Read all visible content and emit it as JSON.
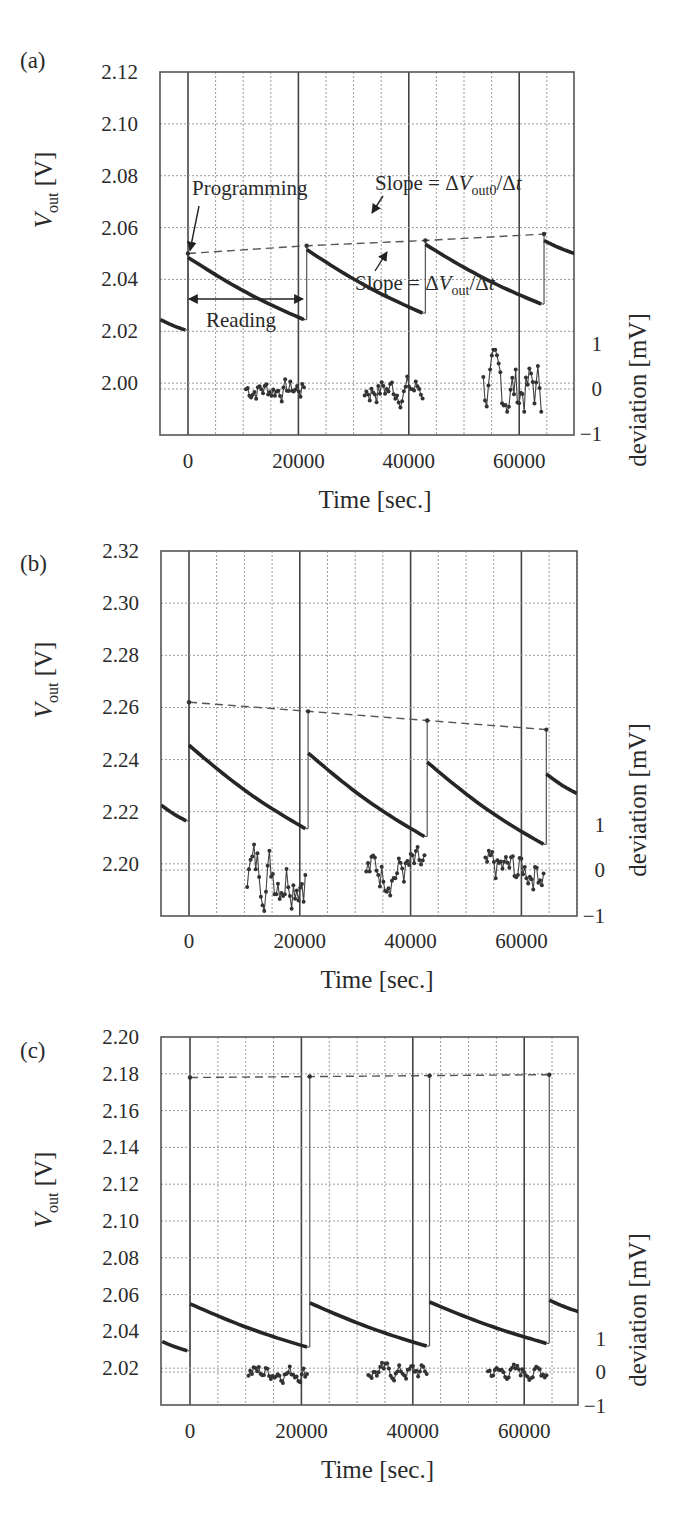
{
  "figure": {
    "width": 696,
    "height": 1529,
    "x_axis_title": "Time [sec.]",
    "y_axis_title_main": "V",
    "y_axis_title_sub": "out",
    "y_axis_title_unit": " [V]",
    "y2_axis_title": "deviation [mV]"
  },
  "chart_data": [
    {
      "panel": "(a)",
      "type": "line",
      "xlabel": "Time [sec.]",
      "ylabel": "V_out [V]",
      "y2label": "deviation [mV]",
      "xlim": [
        -5000,
        70000
      ],
      "ylim": [
        1.98,
        2.12
      ],
      "x_ticks": [
        0,
        20000,
        40000,
        60000
      ],
      "y_ticks": [
        2.0,
        2.02,
        2.04,
        2.06,
        2.08,
        2.1,
        2.12
      ],
      "y_tick_labels": [
        "2.00",
        "2.02",
        "2.04",
        "2.06",
        "2.08",
        "2.10",
        "2.12"
      ],
      "y2_ticks": [
        1,
        0,
        -1
      ],
      "y2_tick_labels": [
        "1",
        "0",
        "−1"
      ],
      "grid": true,
      "programming_times": [
        0,
        21500,
        43000,
        64500
      ],
      "series": [
        {
          "name": "V_out reading",
          "segments": [
            {
              "x": [
                -5000,
                -500
              ],
              "y": [
                2.0245,
                2.0205
              ]
            },
            {
              "x": [
                0,
                21000
              ],
              "y": [
                2.0485,
                2.0245
              ]
            },
            {
              "x": [
                21500,
                42500
              ],
              "y": [
                2.0515,
                2.027
              ]
            },
            {
              "x": [
                43000,
                64000
              ],
              "y": [
                2.0535,
                2.0305
              ]
            },
            {
              "x": [
                64500,
                70000
              ],
              "y": [
                2.055,
                2.05
              ]
            }
          ]
        },
        {
          "name": "V_out0 (programmed)",
          "style": "dashed",
          "x": [
            0,
            21500,
            43000,
            64500
          ],
          "y": [
            2.05,
            2.053,
            2.055,
            2.0575
          ]
        },
        {
          "name": "deviation",
          "axis": "y2",
          "ranges": [
            [
              10500,
              21000
            ],
            [
              32000,
              42500
            ],
            [
              53500,
              64000
            ]
          ],
          "amplitude_mV": [
            0.35,
            0.45,
            0.9
          ]
        }
      ],
      "annotations": [
        {
          "text": "Programming",
          "x": 0,
          "y": 2.05
        },
        {
          "text": "Slope = ΔV_out0/Δt",
          "x": 35000,
          "y": 2.055
        },
        {
          "text": "Slope = ΔV_out/Δt",
          "x": 35000,
          "y": 2.03
        },
        {
          "text": "Reading",
          "x_range": [
            0,
            21000
          ]
        }
      ]
    },
    {
      "panel": "(b)",
      "type": "line",
      "xlabel": "Time [sec.]",
      "ylabel": "V_out [V]",
      "y2label": "deviation [mV]",
      "xlim": [
        -5000,
        70000
      ],
      "ylim": [
        2.18,
        2.32
      ],
      "x_ticks": [
        0,
        20000,
        40000,
        60000
      ],
      "y_ticks": [
        2.2,
        2.22,
        2.24,
        2.26,
        2.28,
        2.3,
        2.32
      ],
      "y_tick_labels": [
        "2.20",
        "2.22",
        "2.24",
        "2.26",
        "2.28",
        "2.30",
        "2.32"
      ],
      "y2_ticks": [
        1,
        0,
        -1
      ],
      "y2_tick_labels": [
        "1",
        "0",
        "−1"
      ],
      "grid": true,
      "programming_times": [
        0,
        21500,
        43000,
        64500
      ],
      "series": [
        {
          "name": "V_out reading",
          "segments": [
            {
              "x": [
                -5000,
                -500
              ],
              "y": [
                2.2225,
                2.2165
              ]
            },
            {
              "x": [
                0,
                21000
              ],
              "y": [
                2.2455,
                2.2135
              ]
            },
            {
              "x": [
                21500,
                42500
              ],
              "y": [
                2.2425,
                2.2105
              ]
            },
            {
              "x": [
                43000,
                64000
              ],
              "y": [
                2.239,
                2.2075
              ]
            },
            {
              "x": [
                64500,
                70000
              ],
              "y": [
                2.2345,
                2.227
              ]
            }
          ]
        },
        {
          "name": "V_out0 (programmed)",
          "style": "dashed",
          "x": [
            0,
            21500,
            43000,
            64500
          ],
          "y": [
            2.262,
            2.2585,
            2.255,
            2.2515
          ]
        },
        {
          "name": "deviation",
          "axis": "y2",
          "ranges": [
            [
              10500,
              21000
            ],
            [
              32000,
              42500
            ],
            [
              53500,
              64000
            ]
          ],
          "amplitude_mV": [
            0.9,
            0.6,
            0.55
          ]
        }
      ],
      "annotations": []
    },
    {
      "panel": "(c)",
      "type": "line",
      "xlabel": "Time [sec.]",
      "ylabel": "V_out [V]",
      "y2label": "deviation [mV]",
      "xlim": [
        -5000,
        70000
      ],
      "ylim": [
        2.0,
        2.2
      ],
      "x_ticks": [
        0,
        20000,
        40000,
        60000
      ],
      "y_ticks": [
        2.02,
        2.04,
        2.06,
        2.08,
        2.1,
        2.12,
        2.14,
        2.16,
        2.18,
        2.2
      ],
      "y_tick_labels": [
        "2.02",
        "2.04",
        "2.06",
        "2.08",
        "2.10",
        "2.12",
        "2.14",
        "2.16",
        "2.18",
        "2.20"
      ],
      "y2_ticks": [
        1,
        0,
        -1
      ],
      "y2_tick_labels": [
        "1",
        "0",
        "−1"
      ],
      "grid": true,
      "programming_times": [
        0,
        21500,
        43000,
        64500
      ],
      "series": [
        {
          "name": "V_out reading",
          "segments": [
            {
              "x": [
                -5000,
                -500
              ],
              "y": [
                2.0345,
                2.0295
              ]
            },
            {
              "x": [
                0,
                21000
              ],
              "y": [
                2.055,
                2.0315
              ]
            },
            {
              "x": [
                21500,
                42500
              ],
              "y": [
                2.0555,
                2.032
              ]
            },
            {
              "x": [
                43000,
                64000
              ],
              "y": [
                2.056,
                2.0335
              ]
            },
            {
              "x": [
                64500,
                70000
              ],
              "y": [
                2.057,
                2.0505
              ]
            }
          ]
        },
        {
          "name": "V_out0 (programmed)",
          "style": "dashed",
          "x": [
            0,
            21500,
            43000,
            64500
          ],
          "y": [
            2.178,
            2.1785,
            2.179,
            2.1795
          ]
        },
        {
          "name": "deviation",
          "axis": "y2",
          "ranges": [
            [
              10500,
              21000
            ],
            [
              32000,
              42500
            ],
            [
              53500,
              64000
            ]
          ],
          "amplitude_mV": [
            0.35,
            0.35,
            0.3
          ]
        }
      ],
      "annotations": []
    }
  ],
  "layout": [
    {
      "frame": [
        160,
        72,
        574,
        435
      ],
      "x0px": 188,
      "pxPer5000": 27.6,
      "y2_zero_px": 389,
      "y2_px_per_mV": 45.3,
      "label_xy": [
        20,
        52
      ],
      "ytitle_x": 52,
      "ytitle_y": 190,
      "y2title_x": 640,
      "y2title_y": 390,
      "x_tick_y": 468,
      "xtitle_y": 508
    },
    {
      "frame": [
        161,
        551,
        577,
        916
      ],
      "x0px": 189,
      "pxPer5000": 27.7,
      "y2_zero_px": 870,
      "y2_px_per_mV": 45.5,
      "label_xy": [
        20,
        555
      ],
      "ytitle_x": 52,
      "ytitle_y": 680,
      "y2title_x": 640,
      "y2title_y": 800,
      "x_tick_y": 948,
      "xtitle_y": 988
    },
    {
      "frame": [
        161,
        1037,
        578,
        1405
      ],
      "x0px": 190,
      "pxPer5000": 27.85,
      "y2_zero_px": 1372,
      "y2_px_per_mV": 33.5,
      "label_xy": [
        20,
        1042
      ],
      "ytitle_x": 52,
      "ytitle_y": 1190,
      "y2title_x": 640,
      "y2title_y": 1310,
      "x_tick_y": 1438,
      "xtitle_y": 1478
    }
  ]
}
